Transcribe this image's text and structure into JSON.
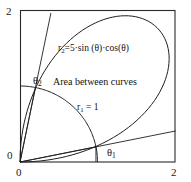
{
  "figure": {
    "background_color": "#ffffff",
    "line_color": "#1a1a1a",
    "frame": {
      "x_left_px": 20,
      "y_top_px": 10,
      "x_right_px": 175,
      "y_bottom_px": 162
    }
  },
  "axes": {
    "x_ticks": [
      "0",
      "2"
    ],
    "y_ticks": [
      "0",
      "2"
    ],
    "x_min_label": "0",
    "x_max_label": "2",
    "y_min_label": "0",
    "y_max_label": "2",
    "xlim": [
      0,
      2
    ],
    "ylim": [
      0,
      2
    ],
    "grid": false
  },
  "labels": {
    "r2_prefix": "r",
    "r2_subscript": "2",
    "r2_expression": "=5·sin (θ)·cos(θ)",
    "r1_prefix": "r",
    "r1_subscript": "1",
    "r1_expression": " = 1",
    "area_text": "Area between curves",
    "theta1_symbol": "θ",
    "theta1_subscript": "1",
    "theta2_symbol": "θ",
    "theta2_subscript": "2"
  },
  "chart_data": {
    "type": "line",
    "title": "",
    "xlabel": "",
    "ylabel": "",
    "xlim": [
      0,
      2
    ],
    "ylim": [
      0,
      2
    ],
    "grid": false,
    "legend": "none",
    "coordinate_system": "polar-on-cartesian",
    "annotations": [
      {
        "text": "r₂=5·sin (θ)·cos(θ)",
        "x": 0.49,
        "y": 1.53
      },
      {
        "text": "r₁ = 1",
        "x": 0.74,
        "y": 0.78
      },
      {
        "text": "Area between curves",
        "x": 0.43,
        "y": 1.08
      },
      {
        "text": "θ₂",
        "x": 0.17,
        "y": 1.11
      },
      {
        "text": "θ₁",
        "x": 1.13,
        "y": 0.18
      }
    ],
    "series": [
      {
        "name": "r1 = 1",
        "equation": "r = 1",
        "color": "#1a1a1a",
        "points_polar_deg": [
          {
            "theta": 0,
            "r": 1
          },
          {
            "theta": 10,
            "r": 1
          },
          {
            "theta": 20,
            "r": 1
          },
          {
            "theta": 30,
            "r": 1
          },
          {
            "theta": 40,
            "r": 1
          },
          {
            "theta": 50,
            "r": 1
          },
          {
            "theta": 60,
            "r": 1
          },
          {
            "theta": 70,
            "r": 1
          },
          {
            "theta": 80,
            "r": 1
          },
          {
            "theta": 90,
            "r": 1
          }
        ]
      },
      {
        "name": "r2 = 5*sin(theta)*cos(theta)",
        "equation": "r = 5·sin(θ)·cos(θ)",
        "color": "#1a1a1a",
        "points_polar_deg": [
          {
            "theta": 0,
            "r": 0
          },
          {
            "theta": 5,
            "r": 0.434
          },
          {
            "theta": 10,
            "r": 0.855
          },
          {
            "theta": 15,
            "r": 1.25
          },
          {
            "theta": 20,
            "r": 1.607
          },
          {
            "theta": 25,
            "r": 1.915
          },
          {
            "theta": 30,
            "r": 2.165
          },
          {
            "theta": 35,
            "r": 2.349
          },
          {
            "theta": 40,
            "r": 2.462
          },
          {
            "theta": 45,
            "r": 2.5
          },
          {
            "theta": 50,
            "r": 2.462
          },
          {
            "theta": 55,
            "r": 2.349
          },
          {
            "theta": 60,
            "r": 2.165
          },
          {
            "theta": 65,
            "r": 1.915
          },
          {
            "theta": 70,
            "r": 1.607
          },
          {
            "theta": 75,
            "r": 1.25
          },
          {
            "theta": 80,
            "r": 0.855
          },
          {
            "theta": 85,
            "r": 0.434
          },
          {
            "theta": 90,
            "r": 0
          }
        ]
      },
      {
        "name": "theta1 ray",
        "equation": "θ = θ1",
        "color": "#1a1a1a",
        "theta_deg": 11.5,
        "r_end": 1.0
      },
      {
        "name": "theta2 ray",
        "equation": "θ = θ2",
        "color": "#1a1a1a",
        "theta_deg": 78.5,
        "r_end": 1.0
      }
    ],
    "intersections": [
      {
        "name": "theta1",
        "theta_deg": 11.5,
        "r": 1.0
      },
      {
        "name": "theta2",
        "theta_deg": 78.5,
        "r": 1.0
      }
    ]
  }
}
